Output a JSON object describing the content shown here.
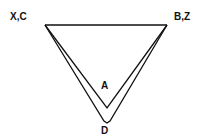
{
  "diagram": {
    "labels": {
      "top_left": "X,C",
      "top_right": "B,Z",
      "inner_vertex": "A",
      "outer_vertex": "D"
    },
    "stroke_color": "#111111",
    "background": "#ffffff"
  }
}
